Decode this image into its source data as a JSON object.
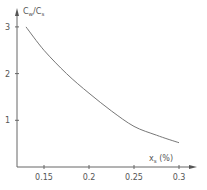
{
  "chart_data": {
    "type": "line",
    "title": "",
    "xlabel": "x_s (%)",
    "ylabel": "C_w/C_s",
    "xlim": [
      0.12,
      0.32
    ],
    "ylim": [
      0,
      3.3
    ],
    "grid": false,
    "legend": null,
    "x_ticks": [
      0.15,
      0.2,
      0.25,
      0.3
    ],
    "x_tick_labels": [
      "0.15",
      "0.2",
      "0.25",
      "0.3"
    ],
    "y_ticks": [
      1,
      2,
      3
    ],
    "y_tick_labels": [
      "1",
      "2",
      "3"
    ],
    "series": [
      {
        "name": "C_w/C_s",
        "x": [
          0.13,
          0.15,
          0.175,
          0.2,
          0.225,
          0.25,
          0.275,
          0.3
        ],
        "values": [
          3.0,
          2.5,
          2.0,
          1.58,
          1.2,
          0.87,
          0.68,
          0.52
        ]
      }
    ]
  },
  "labels": {
    "y_axis_main": "C",
    "y_axis_sub1": "w",
    "y_axis_slash": "/C",
    "y_axis_sub2": "s",
    "x_axis_main": "x",
    "x_axis_sub": "s",
    "x_axis_unit": " (%)"
  },
  "colors": {
    "axis": "#666666",
    "curve": "#777777",
    "text": "#555555"
  }
}
